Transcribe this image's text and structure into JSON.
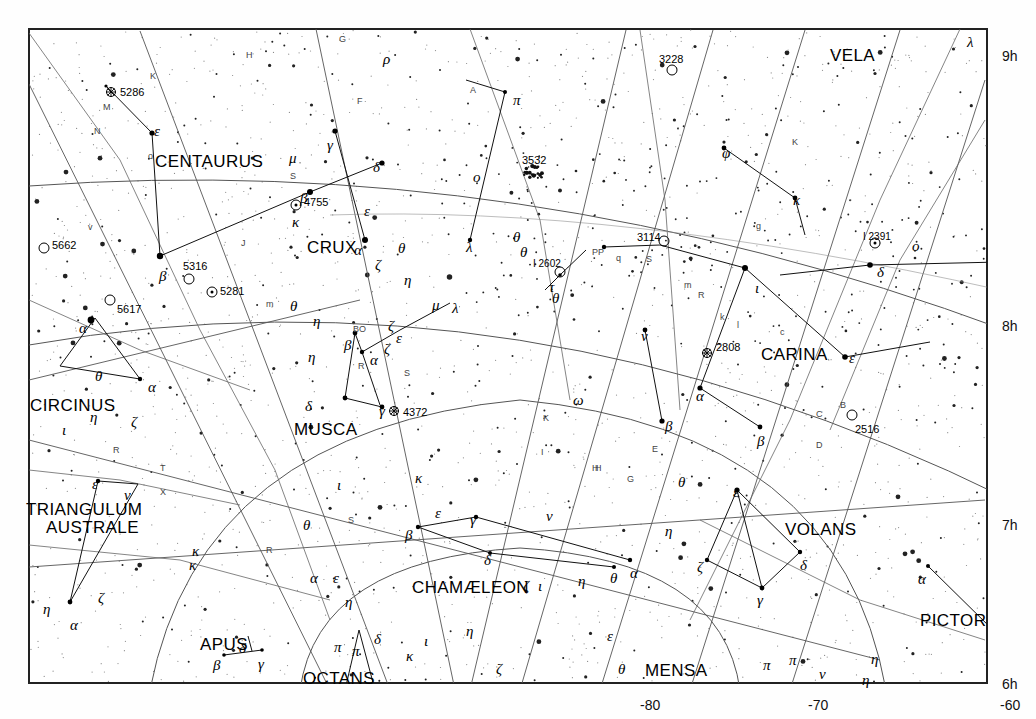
{
  "chart_data": {
    "type": "scatter",
    "xlabel": "Declination",
    "ylabel": "Right Ascension",
    "grid": true,
    "legend": "none",
    "xlim": [
      -90,
      -55
    ],
    "ylim": [
      6,
      9
    ],
    "dec_ticks": [
      {
        "label": "-80",
        "x": 640,
        "y": 697
      },
      {
        "label": "-70",
        "x": 808,
        "y": 697
      },
      {
        "label": "-60",
        "x": 1000,
        "y": 697
      }
    ],
    "ra_ticks": [
      {
        "label": "9h",
        "x": 1002,
        "y": 48
      },
      {
        "label": "8h",
        "x": 1002,
        "y": 318
      },
      {
        "label": "7h",
        "x": 1002,
        "y": 517
      },
      {
        "label": "6h",
        "x": 1002,
        "y": 676
      }
    ],
    "constellations": [
      {
        "name": "VELA",
        "x": 830,
        "y": 46
      },
      {
        "name": "CENTAURUS",
        "x": 155,
        "y": 152
      },
      {
        "name": "CRUX",
        "x": 307,
        "y": 238
      },
      {
        "name": "CARINA",
        "x": 761,
        "y": 345
      },
      {
        "name": "CIRCINUS",
        "x": 30,
        "y": 396
      },
      {
        "name": "MUSCA",
        "x": 294,
        "y": 420
      },
      {
        "name": "TRIANGULUM",
        "x": 26,
        "y": 500
      },
      {
        "name": "AUSTRALE",
        "x": 46,
        "y": 518
      },
      {
        "name": "VOLANS",
        "x": 785,
        "y": 520
      },
      {
        "name": "CHAMÆLEON",
        "x": 412,
        "y": 578
      },
      {
        "name": "APUS",
        "x": 200,
        "y": 635
      },
      {
        "name": "PICTOR",
        "x": 920,
        "y": 611
      },
      {
        "name": "OCTANS",
        "x": 303,
        "y": 669
      },
      {
        "name": "MENSA",
        "x": 645,
        "y": 661
      }
    ],
    "deep_sky": [
      {
        "id": "5286",
        "type": "globular",
        "x": 111,
        "y": 92,
        "lx": 120,
        "ly": 93
      },
      {
        "id": "5662",
        "type": "open",
        "x": 44,
        "y": 248,
        "lx": 52,
        "ly": 246
      },
      {
        "id": "5617",
        "type": "open",
        "x": 110,
        "y": 300,
        "lx": 117,
        "ly": 310
      },
      {
        "id": "5316",
        "type": "open",
        "x": 189,
        "y": 279,
        "lx": 183,
        "ly": 267
      },
      {
        "id": "5281",
        "type": "open",
        "x": 212,
        "y": 292,
        "lx": 220,
        "ly": 292
      },
      {
        "id": "4755",
        "type": "open",
        "x": 296,
        "y": 205,
        "lx": 304,
        "ly": 203
      },
      {
        "id": "4372",
        "type": "globular",
        "x": 394,
        "y": 411,
        "lx": 403,
        "ly": 413
      },
      {
        "id": "3532",
        "type": "open-rich",
        "x": 531,
        "y": 172,
        "lx": 522,
        "ly": 161
      },
      {
        "id": "3228",
        "type": "open",
        "x": 672,
        "y": 70,
        "lx": 659,
        "ly": 60
      },
      {
        "id": "3114",
        "type": "open",
        "x": 664,
        "y": 241,
        "lx": 637,
        "ly": 238
      },
      {
        "id": "2808",
        "type": "globular",
        "x": 707,
        "y": 353,
        "lx": 716,
        "ly": 348
      },
      {
        "id": "2516",
        "type": "open",
        "x": 852,
        "y": 415,
        "lx": 855,
        "ly": 430
      },
      {
        "id": "I 2602",
        "type": "open",
        "x": 560,
        "y": 272,
        "lx": 533,
        "ly": 265
      },
      {
        "id": "I 2391",
        "type": "open",
        "x": 875,
        "y": 243,
        "lx": 863,
        "ly": 238
      }
    ],
    "bayer_labels": [
      {
        "g": "ε",
        "x": 154,
        "y": 123
      },
      {
        "g": "μ",
        "x": 289,
        "y": 150
      },
      {
        "g": "γ",
        "x": 327,
        "y": 137
      },
      {
        "g": "δ",
        "x": 373,
        "y": 159
      },
      {
        "g": "β",
        "x": 300,
        "y": 190
      },
      {
        "g": "κ",
        "x": 292,
        "y": 214
      },
      {
        "g": "ε",
        "x": 364,
        "y": 203
      },
      {
        "g": "α",
        "x": 354,
        "y": 242
      },
      {
        "g": "ζ",
        "x": 375,
        "y": 257
      },
      {
        "g": "η",
        "x": 404,
        "y": 272
      },
      {
        "g": "θ",
        "x": 398,
        "y": 240
      },
      {
        "g": "ρ",
        "x": 383,
        "y": 51
      },
      {
        "g": "π",
        "x": 513,
        "y": 92
      },
      {
        "g": "o",
        "x": 473,
        "y": 169
      },
      {
        "g": "λ",
        "x": 466,
        "y": 239
      },
      {
        "g": "θ",
        "x": 513,
        "y": 229
      },
      {
        "g": "θ",
        "x": 520,
        "y": 244
      },
      {
        "g": "τ",
        "x": 549,
        "y": 279
      },
      {
        "g": "θ",
        "x": 552,
        "y": 290
      },
      {
        "g": "ω",
        "x": 573,
        "y": 392
      },
      {
        "g": "ν",
        "x": 641,
        "y": 328
      },
      {
        "g": "β",
        "x": 665,
        "y": 418
      },
      {
        "g": "α",
        "x": 696,
        "y": 388
      },
      {
        "g": "ι",
        "x": 755,
        "y": 280
      },
      {
        "g": "φ",
        "x": 722,
        "y": 145
      },
      {
        "g": "κ",
        "x": 793,
        "y": 192
      },
      {
        "g": "δ",
        "x": 877,
        "y": 264
      },
      {
        "g": "ο",
        "x": 912,
        "y": 238
      },
      {
        "g": "λ",
        "x": 967,
        "y": 34
      },
      {
        "g": "ε",
        "x": 849,
        "y": 350
      },
      {
        "g": "β",
        "x": 757,
        "y": 433
      },
      {
        "g": "θ",
        "x": 678,
        "y": 474
      },
      {
        "g": "ε",
        "x": 733,
        "y": 484
      },
      {
        "g": "η",
        "x": 665,
        "y": 523
      },
      {
        "g": "ζ",
        "x": 697,
        "y": 559
      },
      {
        "g": "δ",
        "x": 800,
        "y": 557
      },
      {
        "g": "γ",
        "x": 757,
        "y": 592
      },
      {
        "g": "α",
        "x": 918,
        "y": 571
      },
      {
        "g": "η",
        "x": 862,
        "y": 672
      },
      {
        "g": "η",
        "x": 871,
        "y": 651
      },
      {
        "g": "π",
        "x": 789,
        "y": 652
      },
      {
        "g": "π",
        "x": 763,
        "y": 657
      },
      {
        "g": "ν",
        "x": 819,
        "y": 666
      },
      {
        "g": "θ",
        "x": 618,
        "y": 661
      },
      {
        "g": "ε",
        "x": 607,
        "y": 628
      },
      {
        "g": "ζ",
        "x": 496,
        "y": 661
      },
      {
        "g": "η",
        "x": 466,
        "y": 623
      },
      {
        "g": "κ",
        "x": 406,
        "y": 648
      },
      {
        "g": "ι",
        "x": 424,
        "y": 633
      },
      {
        "g": "δ",
        "x": 374,
        "y": 631
      },
      {
        "g": "π",
        "x": 334,
        "y": 639
      },
      {
        "g": "π",
        "x": 352,
        "y": 643
      },
      {
        "g": "η",
        "x": 345,
        "y": 594
      },
      {
        "g": "α",
        "x": 310,
        "y": 570
      },
      {
        "g": "ε",
        "x": 333,
        "y": 570
      },
      {
        "g": "β",
        "x": 405,
        "y": 527
      },
      {
        "g": "γ",
        "x": 470,
        "y": 512
      },
      {
        "g": "δ",
        "x": 484,
        "y": 552
      },
      {
        "g": "ζ",
        "x": 523,
        "y": 578
      },
      {
        "g": "ι",
        "x": 538,
        "y": 578
      },
      {
        "g": "η",
        "x": 578,
        "y": 573
      },
      {
        "g": "θ",
        "x": 610,
        "y": 570
      },
      {
        "g": "α",
        "x": 630,
        "y": 565
      },
      {
        "g": "ν",
        "x": 546,
        "y": 508
      },
      {
        "g": "ε",
        "x": 435,
        "y": 505
      },
      {
        "g": "κ",
        "x": 415,
        "y": 470
      },
      {
        "g": "ι",
        "x": 337,
        "y": 477
      },
      {
        "g": "θ",
        "x": 303,
        "y": 517
      },
      {
        "g": "η",
        "x": 308,
        "y": 349
      },
      {
        "g": "β",
        "x": 344,
        "y": 337
      },
      {
        "g": "α",
        "x": 370,
        "y": 352
      },
      {
        "g": "ζ",
        "x": 388,
        "y": 318
      },
      {
        "g": "ζ",
        "x": 384,
        "y": 341
      },
      {
        "g": "ε",
        "x": 396,
        "y": 330
      },
      {
        "g": "μ",
        "x": 432,
        "y": 297
      },
      {
        "g": "λ",
        "x": 452,
        "y": 300
      },
      {
        "g": "δ",
        "x": 305,
        "y": 398
      },
      {
        "g": "γ",
        "x": 379,
        "y": 403
      },
      {
        "g": "θ",
        "x": 290,
        "y": 298
      },
      {
        "g": "η",
        "x": 313,
        "y": 313
      },
      {
        "g": "β",
        "x": 159,
        "y": 268
      },
      {
        "g": "α",
        "x": 79,
        "y": 320
      },
      {
        "g": "θ",
        "x": 95,
        "y": 368
      },
      {
        "g": "α",
        "x": 148,
        "y": 379
      },
      {
        "g": "η",
        "x": 90,
        "y": 409
      },
      {
        "g": "ι",
        "x": 62,
        "y": 422
      },
      {
        "g": "ζ",
        "x": 131,
        "y": 414
      },
      {
        "g": "ε",
        "x": 92,
        "y": 476
      },
      {
        "g": "ν",
        "x": 124,
        "y": 487
      },
      {
        "g": "ζ",
        "x": 98,
        "y": 590
      },
      {
        "g": "α",
        "x": 70,
        "y": 617
      },
      {
        "g": "η",
        "x": 43,
        "y": 601
      },
      {
        "g": "κ",
        "x": 192,
        "y": 543
      },
      {
        "g": "κ",
        "x": 189,
        "y": 557
      },
      {
        "g": "δ",
        "x": 239,
        "y": 640
      },
      {
        "g": "β",
        "x": 213,
        "y": 657
      },
      {
        "g": "γ",
        "x": 258,
        "y": 656
      }
    ],
    "latin_labels": [
      {
        "t": "G",
        "x": 339,
        "y": 34
      },
      {
        "t": "H",
        "x": 246,
        "y": 50
      },
      {
        "t": "K",
        "x": 150,
        "y": 71
      },
      {
        "t": "M",
        "x": 103,
        "y": 102
      },
      {
        "t": "N",
        "x": 94,
        "y": 126
      },
      {
        "t": "F",
        "x": 357,
        "y": 96
      },
      {
        "t": "A",
        "x": 470,
        "y": 85
      },
      {
        "t": "S",
        "x": 290,
        "y": 171
      },
      {
        "t": "v",
        "x": 88,
        "y": 222
      },
      {
        "t": "J",
        "x": 241,
        "y": 238
      },
      {
        "t": "m",
        "x": 266,
        "y": 299
      },
      {
        "t": "BO",
        "x": 353,
        "y": 324
      },
      {
        "t": "R",
        "x": 358,
        "y": 361
      },
      {
        "t": "S",
        "x": 404,
        "y": 368
      },
      {
        "t": "PP",
        "x": 592,
        "y": 247
      },
      {
        "t": "q",
        "x": 616,
        "y": 253
      },
      {
        "t": "S",
        "x": 646,
        "y": 254
      },
      {
        "t": "m",
        "x": 684,
        "y": 280
      },
      {
        "t": "R",
        "x": 698,
        "y": 290
      },
      {
        "t": "k",
        "x": 720,
        "y": 312
      },
      {
        "t": "l",
        "x": 737,
        "y": 320
      },
      {
        "t": "c",
        "x": 780,
        "y": 327
      },
      {
        "t": "g",
        "x": 756,
        "y": 221
      },
      {
        "t": "B",
        "x": 840,
        "y": 400
      },
      {
        "t": "C",
        "x": 816,
        "y": 409
      },
      {
        "t": "D",
        "x": 816,
        "y": 440
      },
      {
        "t": "E",
        "x": 652,
        "y": 444
      },
      {
        "t": "G",
        "x": 627,
        "y": 474
      },
      {
        "t": "H",
        "x": 595,
        "y": 463
      },
      {
        "t": "K",
        "x": 543,
        "y": 413
      },
      {
        "t": "I",
        "x": 541,
        "y": 447
      },
      {
        "t": "K",
        "x": 792,
        "y": 137
      },
      {
        "t": "T",
        "x": 160,
        "y": 463
      },
      {
        "t": "X",
        "x": 160,
        "y": 487
      },
      {
        "t": "R",
        "x": 113,
        "y": 445
      },
      {
        "t": "R",
        "x": 266,
        "y": 545
      },
      {
        "t": "S",
        "x": 348,
        "y": 515
      },
      {
        "t": "H",
        "x": 592,
        "y": 463
      },
      {
        "t": "o",
        "x": 148,
        "y": 151
      }
    ]
  }
}
